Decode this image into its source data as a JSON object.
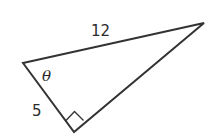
{
  "diagram": {
    "type": "right-triangle",
    "vertices": {
      "left": {
        "x": 23,
        "y": 63
      },
      "right": {
        "x": 204,
        "y": 23
      },
      "right_angle": {
        "x": 74,
        "y": 132
      }
    },
    "labels": {
      "hypotenuse": "12",
      "short_leg": "5",
      "angle": "θ"
    },
    "right_angle_marker": true,
    "stroke_color": "#333333"
  }
}
